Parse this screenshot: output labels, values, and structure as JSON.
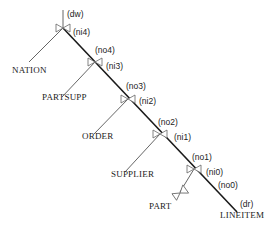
{
  "diagram": {
    "type": "join-tree",
    "relations": {
      "nation": "NATION",
      "partsupp": "PARTSUPP",
      "order": "ORDER",
      "supplier": "SUPPLIER",
      "part": "PART",
      "lineitem": "LINEITEM"
    },
    "ports": {
      "dw": "(dw)",
      "ni4": "(ni4)",
      "no4": "(no4)",
      "ni3": "(ni3)",
      "no3": "(no3)",
      "ni2": "(ni2)",
      "no2": "(no2)",
      "ni1": "(ni1)",
      "no1": "(no1)",
      "ni0": "(ni0)",
      "no0": "(no0)",
      "dr": "(dr)"
    }
  }
}
